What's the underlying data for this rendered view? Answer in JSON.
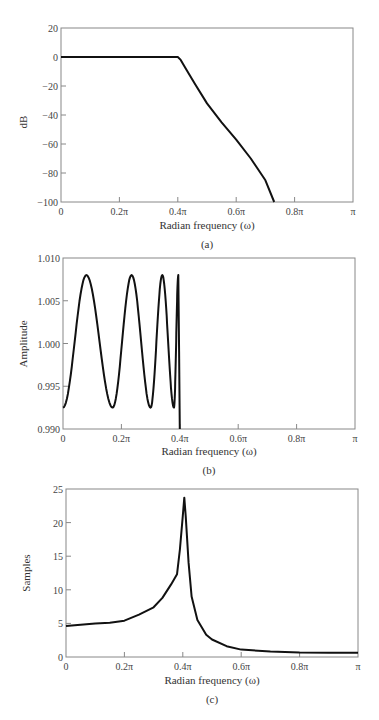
{
  "chart_data": [
    {
      "id": "a",
      "type": "line",
      "caption": "(a)",
      "title": "",
      "xlabel": "Radian frequency (ω)",
      "ylabel": "dB",
      "xlim": [
        0,
        1
      ],
      "ylim": [
        -100,
        20
      ],
      "grid": false,
      "xticks": [
        0,
        0.2,
        0.4,
        0.6,
        0.8,
        1.0
      ],
      "xtick_labels": [
        "0",
        "0.2π",
        "0.4π",
        "0.6π",
        "0.8π",
        "π"
      ],
      "yticks": [
        20,
        0,
        -20,
        -40,
        -60,
        -80,
        -100
      ],
      "ytick_labels": [
        "20",
        "0",
        "−20",
        "−40",
        "−60",
        "−80",
        "−100"
      ],
      "frame": {
        "x0": 61,
        "x1": 353,
        "y0": 28,
        "y1": 202
      },
      "series": [
        {
          "name": "Magnitude response",
          "x": [
            0,
            0.1,
            0.2,
            0.3,
            0.39,
            0.4,
            0.41,
            0.43,
            0.46,
            0.5,
            0.55,
            0.6,
            0.65,
            0.7,
            0.73
          ],
          "y": [
            0,
            0,
            0,
            0,
            0,
            0,
            -2,
            -9,
            -19,
            -32,
            -45,
            -57,
            -70,
            -85,
            -100
          ]
        }
      ]
    },
    {
      "id": "b",
      "type": "line",
      "caption": "(b)",
      "title": "",
      "xlabel": "Radian frequency (ω)",
      "ylabel": "Amplitude",
      "xlim": [
        0,
        1
      ],
      "ylim": [
        0.99,
        1.01
      ],
      "grid": false,
      "xticks": [
        0,
        0.2,
        0.4,
        0.6,
        0.8,
        1.0
      ],
      "xtick_labels": [
        "0",
        "0.2π",
        "0.4π",
        "0.6π",
        "0.8π",
        "π"
      ],
      "yticks": [
        1.01,
        1.005,
        1.0,
        0.995,
        0.99
      ],
      "ytick_labels": [
        "1.010",
        "1.005",
        "1.000",
        "0.995",
        "0.990"
      ],
      "frame": {
        "x0": 63,
        "x1": 355,
        "y0": 258,
        "y1": 429
      },
      "series": [
        {
          "name": "Passband ripple",
          "extrema_x": [
            0,
            0.08,
            0.17,
            0.235,
            0.3,
            0.34,
            0.38,
            0.395,
            0.4
          ],
          "extrema_y": [
            0.9925,
            1.008,
            0.9925,
            1.008,
            0.9925,
            1.008,
            0.9925,
            1.008,
            0.99
          ]
        }
      ]
    },
    {
      "id": "c",
      "type": "line",
      "caption": "(c)",
      "title": "",
      "xlabel": "Radian frequency (ω)",
      "ylabel": "Samples",
      "xlim": [
        0,
        1
      ],
      "ylim": [
        0,
        25
      ],
      "grid": false,
      "xticks": [
        0,
        0.2,
        0.4,
        0.6,
        0.8,
        1.0
      ],
      "xtick_labels": [
        "0",
        "0.2π",
        "0.4π",
        "0.6π",
        "0.8π",
        "π"
      ],
      "yticks": [
        25,
        20,
        15,
        10,
        5,
        0
      ],
      "ytick_labels": [
        "25",
        "20",
        "15",
        "10",
        "5",
        "0"
      ],
      "frame": {
        "x0": 66,
        "x1": 358,
        "y0": 489,
        "y1": 657
      },
      "series": [
        {
          "name": "Group delay",
          "x": [
            0,
            0.05,
            0.1,
            0.15,
            0.2,
            0.25,
            0.3,
            0.33,
            0.36,
            0.38,
            0.39,
            0.4,
            0.405,
            0.41,
            0.42,
            0.43,
            0.45,
            0.48,
            0.5,
            0.55,
            0.6,
            0.7,
            0.8,
            0.9,
            1.0
          ],
          "y": [
            4.6,
            4.8,
            5.0,
            5.1,
            5.4,
            6.3,
            7.4,
            8.8,
            10.8,
            12.3,
            16,
            21,
            23.7,
            21,
            14,
            9,
            5.5,
            3.3,
            2.6,
            1.6,
            1.1,
            0.8,
            0.65,
            0.62,
            0.62
          ]
        }
      ]
    }
  ]
}
